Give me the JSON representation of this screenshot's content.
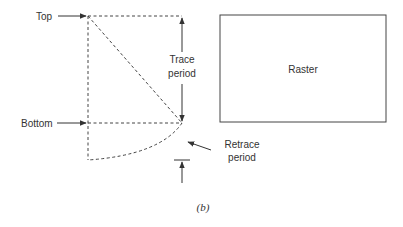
{
  "diagram": {
    "labels": {
      "top": "Top",
      "bottom": "Bottom",
      "trace_line1": "Trace",
      "trace_line2": "period",
      "retrace_line1": "Retrace",
      "retrace_line2": "period",
      "raster": "Raster"
    },
    "caption": "(b)",
    "colors": {
      "stroke": "#333333",
      "dashed": "#444444",
      "background": "#ffffff"
    }
  }
}
